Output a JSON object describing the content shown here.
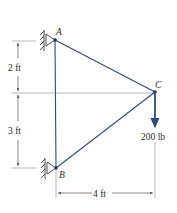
{
  "diagram": {
    "type": "truss-statics",
    "colors": {
      "member": "#2f4a7a",
      "dimension": "#555555",
      "extension": "#9a9a9a",
      "support": "#3a3a3a",
      "text": "#2b2b2b"
    },
    "nodes": [
      {
        "id": "A",
        "label": "A",
        "x": 55,
        "y": 40,
        "support": "pin"
      },
      {
        "id": "B",
        "label": "B",
        "x": 56,
        "y": 168,
        "support": "pin"
      },
      {
        "id": "C",
        "label": "C",
        "x": 155,
        "y": 92,
        "support": "none"
      }
    ],
    "members": [
      {
        "from": "A",
        "to": "B"
      },
      {
        "from": "A",
        "to": "C"
      },
      {
        "from": "B",
        "to": "C"
      }
    ],
    "load": {
      "node": "C",
      "direction": "down",
      "label": "200 lb"
    },
    "dimensions": {
      "vertical_upper": "2 ft",
      "vertical_lower": "3 ft",
      "horizontal": "4 ft"
    }
  }
}
